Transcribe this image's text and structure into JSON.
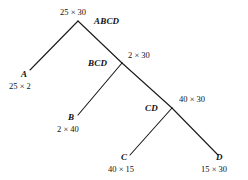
{
  "diagram": {
    "type": "binary-parse-tree",
    "multiply_symbol": "×",
    "nodes": [
      {
        "id": "ABCD",
        "label": "ABCD",
        "dims": "25 × 30",
        "role": "root",
        "x": 78,
        "y": 21
      },
      {
        "id": "BCD",
        "label": "BCD",
        "dims": "2 × 30",
        "role": "internal",
        "x": 122,
        "y": 63
      },
      {
        "id": "CD",
        "label": "CD",
        "dims": "40 × 30",
        "role": "internal",
        "x": 172,
        "y": 108
      },
      {
        "id": "A",
        "label": "A",
        "dims": "25 × 2",
        "role": "leaf",
        "x": 30,
        "y": 70
      },
      {
        "id": "B",
        "label": "B",
        "dims": "2 × 40",
        "role": "leaf",
        "x": 78,
        "y": 115
      },
      {
        "id": "C",
        "label": "C",
        "dims": "40 × 15",
        "role": "leaf",
        "x": 130,
        "y": 155
      },
      {
        "id": "D",
        "label": "D",
        "dims": "15 × 30",
        "role": "leaf",
        "x": 218,
        "y": 155
      }
    ],
    "edges": [
      {
        "id": "edge-abcd-a",
        "from": "ABCD",
        "to": "A",
        "x1": 78,
        "y1": 21,
        "x2": 30,
        "y2": 70
      },
      {
        "id": "edge-abcd-bcd",
        "from": "ABCD",
        "to": "BCD",
        "x1": 78,
        "y1": 21,
        "x2": 122,
        "y2": 63
      },
      {
        "id": "edge-bcd-b",
        "from": "BCD",
        "to": "B",
        "x1": 122,
        "y1": 63,
        "x2": 78,
        "y2": 115
      },
      {
        "id": "edge-bcd-cd",
        "from": "BCD",
        "to": "CD",
        "x1": 122,
        "y1": 63,
        "x2": 172,
        "y2": 108
      },
      {
        "id": "edge-cd-c",
        "from": "CD",
        "to": "C",
        "x1": 172,
        "y1": 108,
        "x2": 130,
        "y2": 155
      },
      {
        "id": "edge-cd-d",
        "from": "CD",
        "to": "D",
        "x1": 172,
        "y1": 108,
        "x2": 218,
        "y2": 155
      }
    ],
    "line_color": "#1a1a1a",
    "text_color": "#111111",
    "background_color": "#ffffff",
    "labels": {
      "root_name": "ABCD",
      "root_dims": "25 × 30",
      "bcd_name": "BCD",
      "bcd_dims": "2 × 30",
      "cd_name": "CD",
      "cd_dims": "40 × 30",
      "a_name": "A",
      "a_dims": "25 × 2",
      "b_name": "B",
      "b_dims": "2 × 40",
      "c_name": "C",
      "c_dims": "40 × 15",
      "d_name": "D",
      "d_dims": "15 × 30"
    }
  }
}
